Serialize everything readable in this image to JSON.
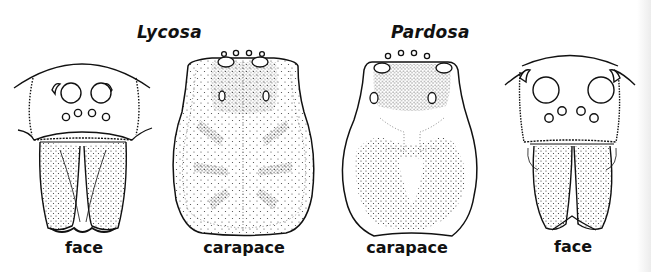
{
  "figure": {
    "groups": [
      {
        "genus": "Lycosa",
        "panels": [
          {
            "view": "face",
            "label": "face"
          },
          {
            "view": "carapace",
            "label": "carapace"
          }
        ]
      },
      {
        "genus": "Pardosa",
        "panels": [
          {
            "view": "carapace",
            "label": "carapace"
          },
          {
            "view": "face",
            "label": "face"
          }
        ]
      }
    ],
    "colors": {
      "ink": "#111111",
      "background": "#ffffff",
      "stipple": "#333333"
    }
  }
}
